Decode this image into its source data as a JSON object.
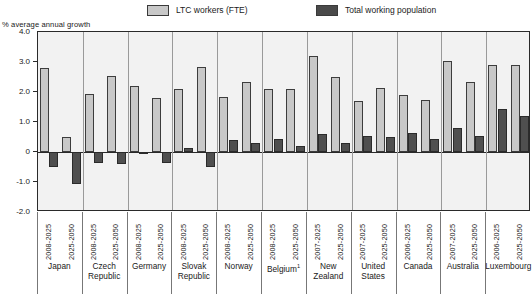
{
  "legend": {
    "items": [
      {
        "label": "LTC workers (FTE)",
        "color": "#c8c8c8",
        "key": "ltc"
      },
      {
        "label": "Total working population",
        "color": "#4f4f4f",
        "key": "total"
      }
    ]
  },
  "axis": {
    "y_title": "% average annual growth",
    "y_ticks": [
      "4.0",
      "3.0",
      "2.0",
      "1.0",
      "0",
      "-1.0",
      "-2.0"
    ]
  },
  "footnote_marker": "1",
  "chart_data": {
    "type": "bar",
    "title": "",
    "xlabel": "",
    "ylabel": "% average annual growth",
    "ylim": [
      -2.0,
      4.0
    ],
    "ytick_values": [
      4.0,
      3.0,
      2.0,
      1.0,
      0,
      -1.0,
      -2.0
    ],
    "grid": false,
    "legend_position": "top",
    "categories": [
      "Japan 2008-2025",
      "Japan 2025-2050",
      "Czech Republic 2008-2025",
      "Czech Republic 2025-2050",
      "Germany 2008-2025",
      "Germany 2025-2050",
      "Slovak Republic 2008-2025",
      "Slovak Republic 2025-2050",
      "Norway 2008-2025",
      "Norway 2025-2050",
      "Belgium 2008-2025",
      "Belgium 2025-2050",
      "New Zealand 2007-2025",
      "New Zealand 2025-2050",
      "United States 2007-2025",
      "United States 2025-2050",
      "Canada 2006-2025",
      "Canada 2025-2050",
      "Australia 2007-2025",
      "Australia 2025-2050",
      "Luxembourg 2006-2025",
      "Luxembourg 2025-2050"
    ],
    "series": [
      {
        "name": "LTC workers (FTE)",
        "color": "#c8c8c8",
        "values": [
          2.8,
          0.5,
          1.95,
          2.55,
          2.2,
          1.8,
          2.1,
          2.85,
          1.85,
          2.35,
          2.1,
          2.1,
          3.2,
          2.5,
          1.7,
          2.15,
          1.9,
          1.75,
          3.05,
          2.35,
          2.9,
          2.9
        ]
      },
      {
        "name": "Total working population",
        "color": "#4f4f4f",
        "values": [
          -0.5,
          -1.05,
          -0.35,
          -0.4,
          -0.05,
          -0.35,
          0.15,
          -0.5,
          0.4,
          0.3,
          0.45,
          0.2,
          0.6,
          0.3,
          0.55,
          0.5,
          0.65,
          0.45,
          0.8,
          0.55,
          1.45,
          1.2
        ]
      }
    ],
    "groups": [
      {
        "country": "Japan",
        "periods": [
          "2008-2025",
          "2025-2050"
        ],
        "ltc": [
          2.8,
          0.5
        ],
        "total": [
          -0.5,
          -1.05
        ]
      },
      {
        "country": "Czech\nRepublic",
        "periods": [
          "2008-2025",
          "2025-2050"
        ],
        "ltc": [
          1.95,
          2.55
        ],
        "total": [
          -0.35,
          -0.4
        ]
      },
      {
        "country": "Germany",
        "periods": [
          "2008-2025",
          "2025-2050"
        ],
        "ltc": [
          2.2,
          1.8
        ],
        "total": [
          -0.05,
          -0.35
        ]
      },
      {
        "country": "Slovak\nRepublic",
        "periods": [
          "2008-2025",
          "2025-2050"
        ],
        "ltc": [
          2.1,
          2.85
        ],
        "total": [
          0.15,
          -0.5
        ]
      },
      {
        "country": "Norway",
        "periods": [
          "2008-2025",
          "2025-2050"
        ],
        "ltc": [
          1.85,
          2.35
        ],
        "total": [
          0.4,
          0.3
        ]
      },
      {
        "country": "Belgium",
        "periods": [
          "2008-2025",
          "2025-2050"
        ],
        "ltc": [
          2.1,
          2.1
        ],
        "total": [
          0.45,
          0.2
        ],
        "footnote": "1"
      },
      {
        "country": "New\nZealand",
        "periods": [
          "2007-2025",
          "2025-2050"
        ],
        "ltc": [
          3.2,
          2.5
        ],
        "total": [
          0.6,
          0.3
        ]
      },
      {
        "country": "United\nStates",
        "periods": [
          "2007-2025",
          "2025-2050"
        ],
        "ltc": [
          1.7,
          2.15
        ],
        "total": [
          0.55,
          0.5
        ]
      },
      {
        "country": "Canada",
        "periods": [
          "2006-2025",
          "2025-2050"
        ],
        "ltc": [
          1.9,
          1.75
        ],
        "total": [
          0.65,
          0.45
        ]
      },
      {
        "country": "Australia",
        "periods": [
          "2007-2025",
          "2025-2050"
        ],
        "ltc": [
          3.05,
          2.35
        ],
        "total": [
          0.8,
          0.55
        ]
      },
      {
        "country": "Luxembourg",
        "periods": [
          "2006-2025",
          "2025-2050"
        ],
        "ltc": [
          2.9,
          2.9
        ],
        "total": [
          1.45,
          1.2
        ]
      }
    ]
  }
}
